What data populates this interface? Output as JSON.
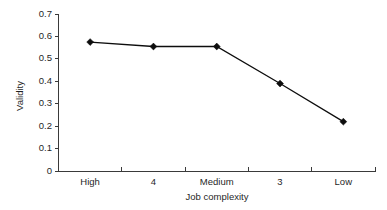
{
  "chart_data": {
    "type": "line",
    "title": "",
    "subtitle": "",
    "xlabel": "Job complexity",
    "ylabel": "Validity",
    "categories": [
      "High",
      "4",
      "Medium",
      "3",
      "Low"
    ],
    "values": [
      0.575,
      0.555,
      0.555,
      0.39,
      0.22
    ],
    "series": [
      {
        "name": "Validity",
        "values": [
          0.575,
          0.555,
          0.555,
          0.39,
          0.22
        ]
      }
    ],
    "ylim": [
      0,
      0.7
    ],
    "ytick_values": [
      0,
      0.1,
      0.2,
      0.3,
      0.4,
      0.5,
      0.6,
      0.7
    ],
    "ytick_labels": [
      "0",
      "0.1",
      "0.2",
      "0.3",
      "0.4",
      "0.5",
      "0.6",
      "0.7"
    ],
    "xtick_labels": [
      "High",
      "4",
      "Medium",
      "3",
      "Low"
    ],
    "grid": false,
    "legend": false,
    "legend_position": "none",
    "marker": "diamond",
    "line_color": "#0d0d0d",
    "marker_color": "#0d0d0d",
    "axis_color": "#3a3a3a",
    "background_color": "#ffffff"
  },
  "axes": {
    "y_title": "Validity",
    "x_title": "Job complexity",
    "y_ticks": [
      {
        "label": "0.7",
        "value": 0.7
      },
      {
        "label": "0.6",
        "value": 0.6
      },
      {
        "label": "0.5",
        "value": 0.5
      },
      {
        "label": "0.4",
        "value": 0.4
      },
      {
        "label": "0.3",
        "value": 0.3
      },
      {
        "label": "0.2",
        "value": 0.2
      },
      {
        "label": "0.1",
        "value": 0.1
      },
      {
        "label": "0",
        "value": 0
      }
    ],
    "x_categories": [
      {
        "label": "High",
        "value": 0.575
      },
      {
        "label": "4",
        "value": 0.555
      },
      {
        "label": "Medium",
        "value": 0.555
      },
      {
        "label": "3",
        "value": 0.39
      },
      {
        "label": "Low",
        "value": 0.22
      }
    ]
  }
}
